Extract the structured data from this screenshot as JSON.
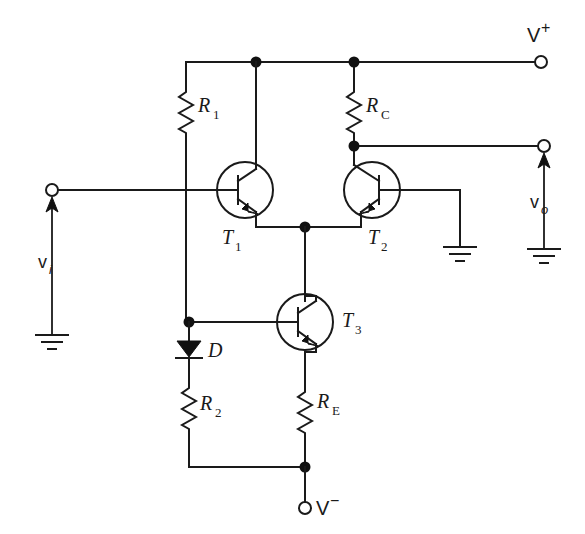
{
  "figure": {
    "kind": "schematic",
    "background_color": "#ffffff",
    "line_color": "#1a1a1a"
  },
  "components": {
    "resistors": [
      {
        "id": "R1",
        "label": "R",
        "subscript": "1",
        "name": "resistor-r1"
      },
      {
        "id": "RC",
        "label": "R",
        "subscript": "C",
        "name": "resistor-rc"
      },
      {
        "id": "R2",
        "label": "R",
        "subscript": "2",
        "name": "resistor-r2"
      },
      {
        "id": "RE",
        "label": "R",
        "subscript": "E",
        "name": "resistor-re"
      }
    ],
    "transistors": [
      {
        "id": "T1",
        "label": "T",
        "subscript": "1",
        "name": "transistor-t1",
        "type": "npn"
      },
      {
        "id": "T2",
        "label": "T",
        "subscript": "2",
        "name": "transistor-t2",
        "type": "npn"
      },
      {
        "id": "T3",
        "label": "T",
        "subscript": "3",
        "name": "transistor-t3",
        "type": "npn"
      }
    ],
    "diodes": [
      {
        "id": "D",
        "label": "D",
        "name": "diode-d"
      }
    ]
  },
  "terminals": {
    "v_plus": {
      "label": "V",
      "superscript": "+",
      "name": "terminal-v-plus"
    },
    "v_minus": {
      "label": "V",
      "superscript": "−",
      "name": "terminal-v-minus"
    },
    "v_in": {
      "label": "v",
      "subscript": "i",
      "name": "terminal-v-in"
    },
    "v_out": {
      "label": "v",
      "subscript": "o",
      "name": "terminal-v-out"
    }
  },
  "grounds": [
    {
      "id": "gnd-input",
      "name": "ground-symbol-input"
    },
    {
      "id": "gnd-t2-base",
      "name": "ground-symbol-t2-base"
    },
    {
      "id": "gnd-output",
      "name": "ground-symbol-output"
    }
  ],
  "nodes": [
    {
      "id": "n-top-left",
      "name": "junction-top-left"
    },
    {
      "id": "n-top-right",
      "name": "junction-top-right"
    },
    {
      "id": "n-collector-t2",
      "name": "junction-t2-collector-output"
    },
    {
      "id": "n-emitter-pair",
      "name": "junction-emitter-pair"
    },
    {
      "id": "n-bias",
      "name": "junction-bias-diode"
    },
    {
      "id": "n-bottom",
      "name": "junction-negative-rail"
    }
  ]
}
